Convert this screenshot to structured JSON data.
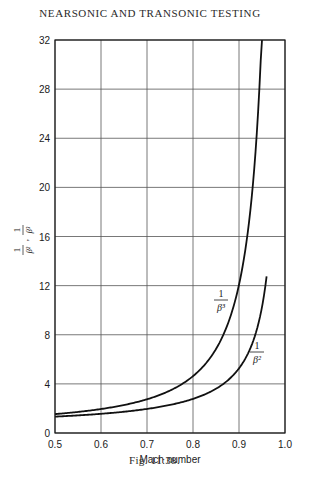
{
  "page": {
    "header": "NEARSONIC AND TRANSONIC TESTING",
    "caption": "Fig. 11:38."
  },
  "chart_data": {
    "type": "line",
    "title": "",
    "xlabel": "Mach number",
    "ylabel": "1/β², 1/β³",
    "xlim": [
      0.5,
      1.0
    ],
    "ylim": [
      0,
      32
    ],
    "x_ticks": [
      "0.5",
      "0.6",
      "0.7",
      "0.8",
      "0.9",
      "1.0"
    ],
    "y_ticks": [
      "0",
      "4",
      "8",
      "12",
      "16",
      "20",
      "24",
      "28",
      "32"
    ],
    "grid": true,
    "legend": "inline curve labels",
    "series": [
      {
        "name": "1/β²",
        "label_num": "1",
        "label_den": "β²",
        "x": [
          0.5,
          0.55,
          0.6,
          0.65,
          0.7,
          0.75,
          0.8,
          0.85,
          0.9,
          0.92,
          0.94,
          0.955,
          0.96
        ],
        "values": [
          1.33,
          1.43,
          1.56,
          1.73,
          1.96,
          2.29,
          2.78,
          3.6,
          5.26,
          6.51,
          8.59,
          11.4,
          12.76
        ]
      },
      {
        "name": "1/β³",
        "label_num": "1",
        "label_den": "β³",
        "x": [
          0.5,
          0.55,
          0.6,
          0.65,
          0.7,
          0.75,
          0.8,
          0.85,
          0.88,
          0.9,
          0.92,
          0.93,
          0.94,
          0.945,
          0.95
        ],
        "values": [
          1.54,
          1.71,
          1.95,
          2.28,
          2.75,
          3.46,
          4.63,
          6.83,
          9.09,
          12.07,
          16.6,
          20.0,
          25.2,
          28.8,
          32.0
        ]
      }
    ]
  }
}
